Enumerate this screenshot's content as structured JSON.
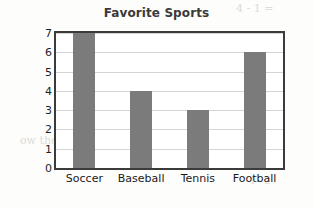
{
  "chart_data": {
    "type": "bar",
    "title": "Favorite Sports",
    "xlabel": "",
    "ylabel": "Number of Students",
    "categories": [
      "Soccer",
      "Baseball",
      "Tennis",
      "Football"
    ],
    "values": [
      7,
      4,
      3,
      6
    ],
    "ylim": [
      0,
      7
    ],
    "y_ticks": [
      "0",
      "1",
      "2",
      "3",
      "4",
      "5",
      "6",
      "7"
    ],
    "grid": "horizontal",
    "legend": "none",
    "bar_color": "#7b7b7b",
    "frame_color": "#3b3b3b",
    "gridline_color": "#d5d5d5",
    "title_color": "#3a3a3a"
  },
  "background_text": {
    "line1": "4 - 1 =",
    "line2": "ght a number bar the we",
    "line3": "nonth. He sold a 2 - 3 fo",
    "line4": "the correct tota",
    "line5": "ow the the of a",
    "line6": "1 - 2"
  }
}
